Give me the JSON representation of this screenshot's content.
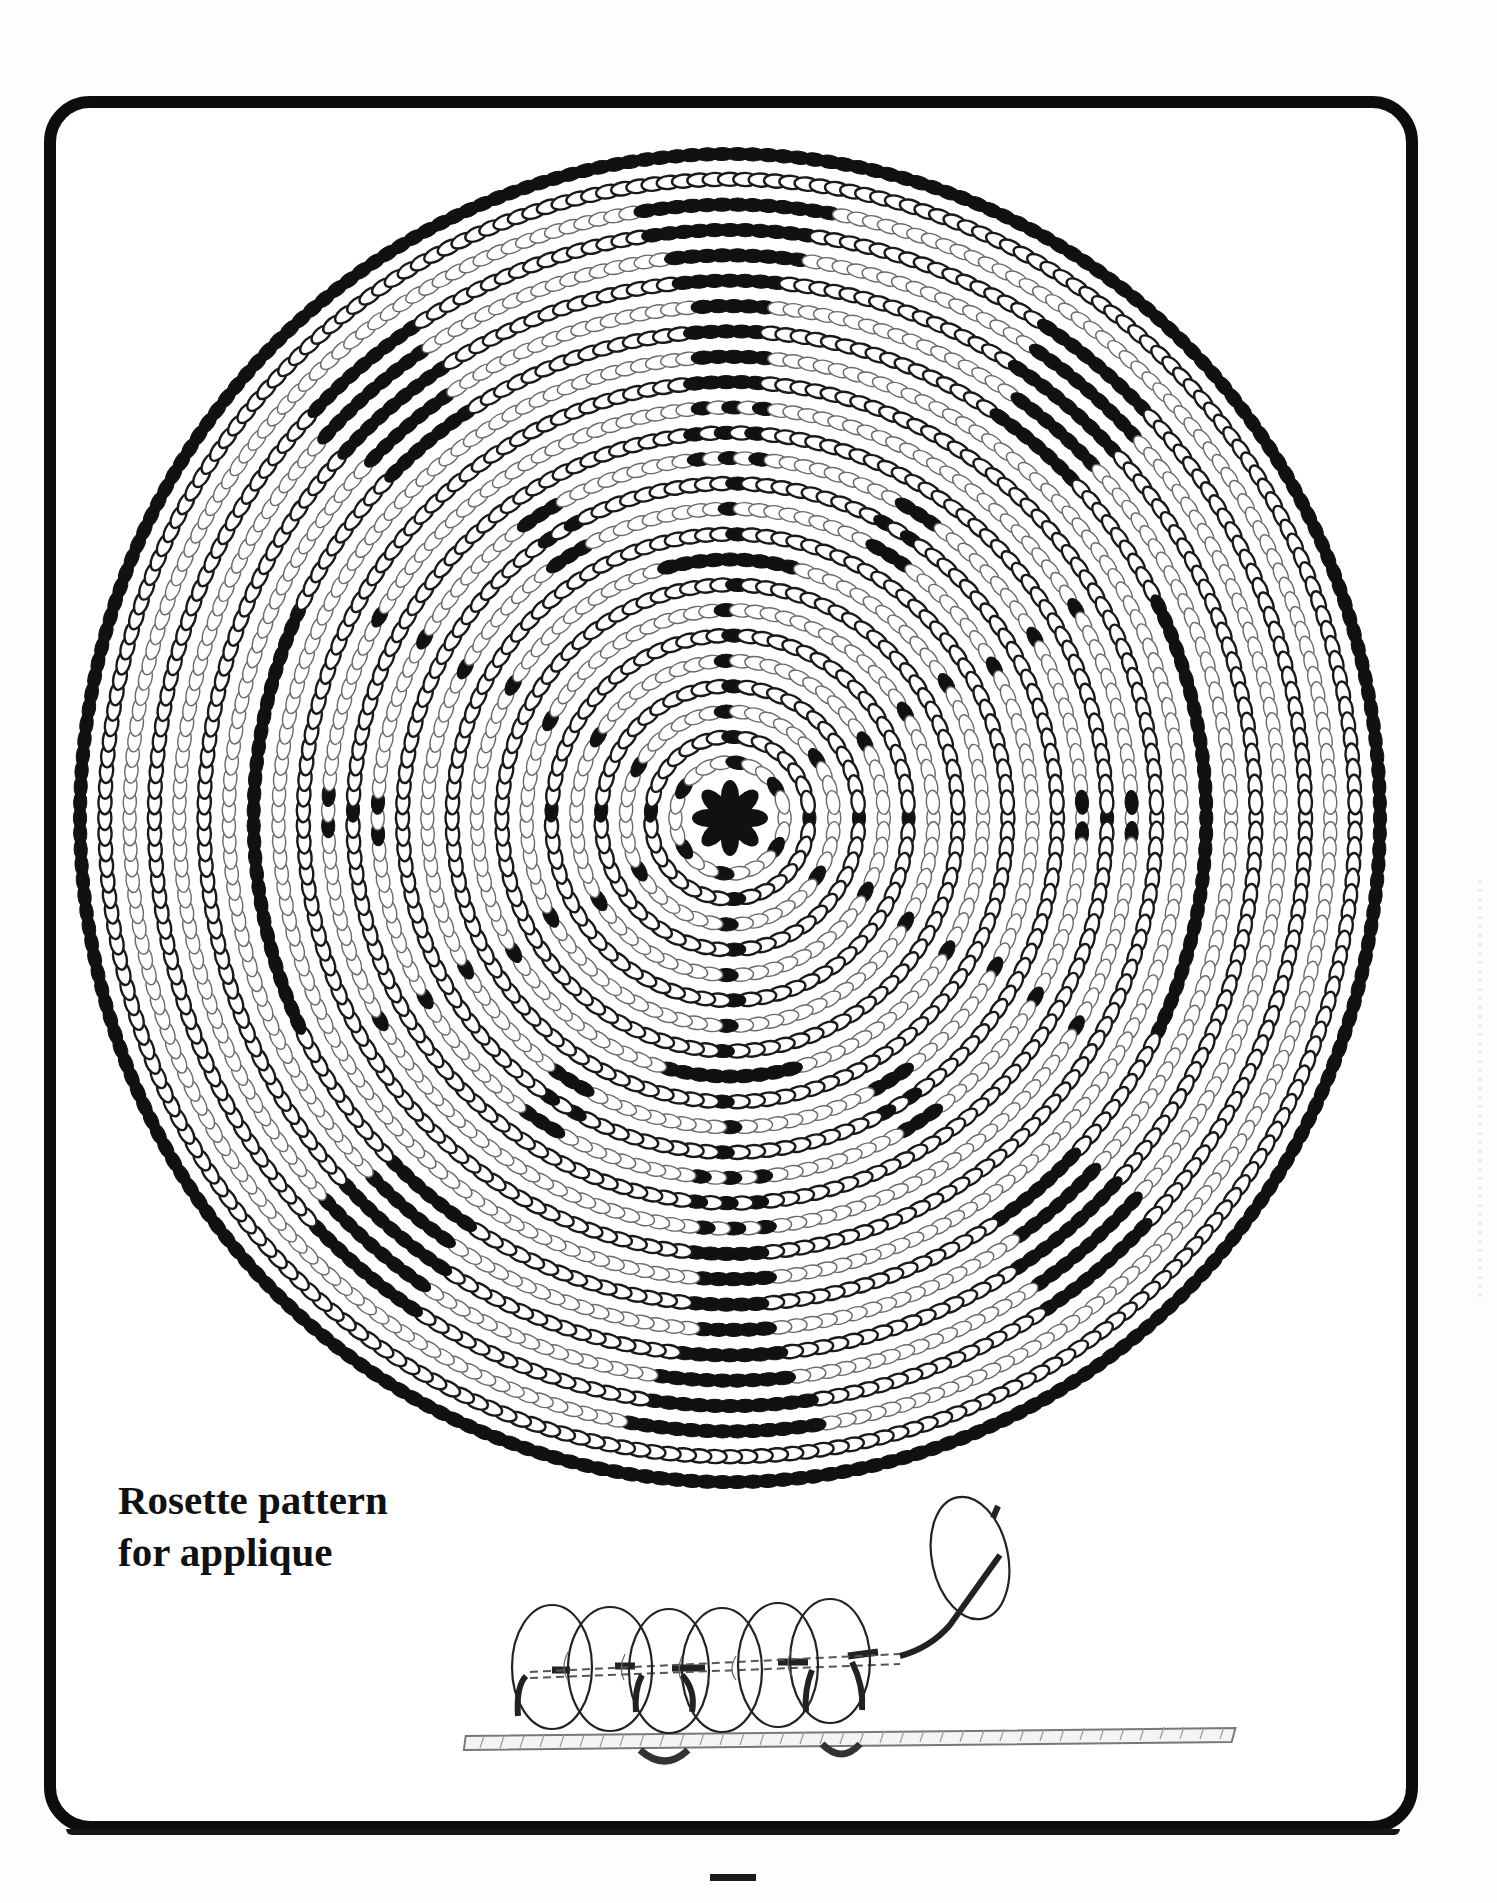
{
  "page": {
    "caption": {
      "line1": "Rosette pattern",
      "line2": "for applique"
    },
    "page_number_mark": "—"
  },
  "colors": {
    "ink": "#111111",
    "bead_outline_dark": "#1a1a1a",
    "bead_outline_light": "#6a6a6a",
    "paper": "#ffffff",
    "frame": "#0d0d0d"
  },
  "rosette": {
    "center": [
      730,
      818
    ],
    "radius_x": 650,
    "radius_y": 664,
    "ring_count": 26,
    "ring_style_pattern": [
      "filled",
      "dark",
      "light",
      "dark",
      "light",
      "dark",
      "light",
      "dark",
      "light",
      "dark",
      "light",
      "dark",
      "light",
      "dark",
      "light",
      "dark",
      "light",
      "dark",
      "light",
      "dark",
      "light",
      "dark",
      "light",
      "dark",
      "light",
      "dark"
    ],
    "center_flower": {
      "petals": 8,
      "description": "8-petal black bead flower"
    },
    "spokes": {
      "count": 8,
      "description": "radial lines of single black beads from center"
    },
    "motifs": [
      {
        "name": "top-bar-stack",
        "angle": -90,
        "type": "stacked-bars"
      },
      {
        "name": "bottom-bar-stack",
        "angle": 90,
        "type": "stacked-bars"
      },
      {
        "name": "upper-left-bars",
        "angle": -135,
        "type": "stacked-bars"
      },
      {
        "name": "upper-right-bars",
        "angle": -45,
        "type": "stacked-bars"
      },
      {
        "name": "lower-left-bars",
        "angle": 135,
        "type": "stacked-bars"
      },
      {
        "name": "lower-right-bars",
        "angle": 45,
        "type": "stacked-bars"
      },
      {
        "name": "left-arc",
        "angle": 180,
        "type": "arc"
      },
      {
        "name": "right-arc",
        "angle": 0,
        "type": "arc"
      },
      {
        "name": "inner-top-arc",
        "angle": -90,
        "type": "inner-arc"
      },
      {
        "name": "inner-bottom-arc",
        "angle": 90,
        "type": "inner-arc"
      },
      {
        "name": "left-cross",
        "angle": 180,
        "type": "cross"
      },
      {
        "name": "right-cross",
        "angle": 0,
        "type": "cross"
      },
      {
        "name": "diag-checks",
        "angles": [
          -120,
          -60,
          60,
          120
        ],
        "type": "checker"
      }
    ]
  },
  "sketch": {
    "description": "Side view of beads stitched onto a strip of leather (applique stitch)",
    "bead_count_on_strip": 6,
    "loose_bead_on_thread": 1
  }
}
